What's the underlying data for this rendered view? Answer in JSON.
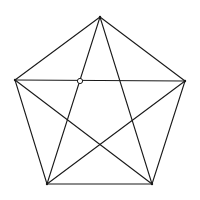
{
  "diagram": {
    "title": "",
    "type": "complete-graph-K5-pentagon",
    "stroke_color": "#1a1a1a",
    "background": "#ffffff",
    "vertices": [
      {
        "id": "top",
        "x": 100,
        "y": 17
      },
      {
        "id": "right",
        "x": 185,
        "y": 81
      },
      {
        "id": "bottom-right",
        "x": 152,
        "y": 184
      },
      {
        "id": "bottom-left",
        "x": 47,
        "y": 184
      },
      {
        "id": "left",
        "x": 15,
        "y": 80
      }
    ],
    "edges": [
      [
        "top",
        "right"
      ],
      [
        "right",
        "bottom-right"
      ],
      [
        "bottom-right",
        "bottom-left"
      ],
      [
        "bottom-left",
        "left"
      ],
      [
        "left",
        "top"
      ],
      [
        "top",
        "bottom-right"
      ],
      [
        "top",
        "bottom-left"
      ],
      [
        "left",
        "right"
      ],
      [
        "left",
        "bottom-right"
      ],
      [
        "right",
        "bottom-left"
      ]
    ],
    "markers": [
      {
        "id": "open-circle",
        "x": 80,
        "y": 81,
        "r": 2.6,
        "fill": "#ffffff"
      }
    ]
  }
}
